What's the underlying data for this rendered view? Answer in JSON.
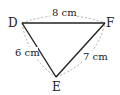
{
  "diagram": {
    "type": "triangle",
    "vertices": [
      {
        "name": "D",
        "label": "D"
      },
      {
        "name": "F",
        "label": "F"
      },
      {
        "name": "E",
        "label": "E"
      }
    ],
    "sides": [
      {
        "from": "D",
        "to": "F",
        "label": "8 cm"
      },
      {
        "from": "D",
        "to": "E",
        "label": "6 cm"
      },
      {
        "from": "E",
        "to": "F",
        "label": "7 cm"
      }
    ],
    "colors": {
      "edge": "#222222",
      "dashed_arc": "#999999",
      "text": "#222222"
    }
  }
}
